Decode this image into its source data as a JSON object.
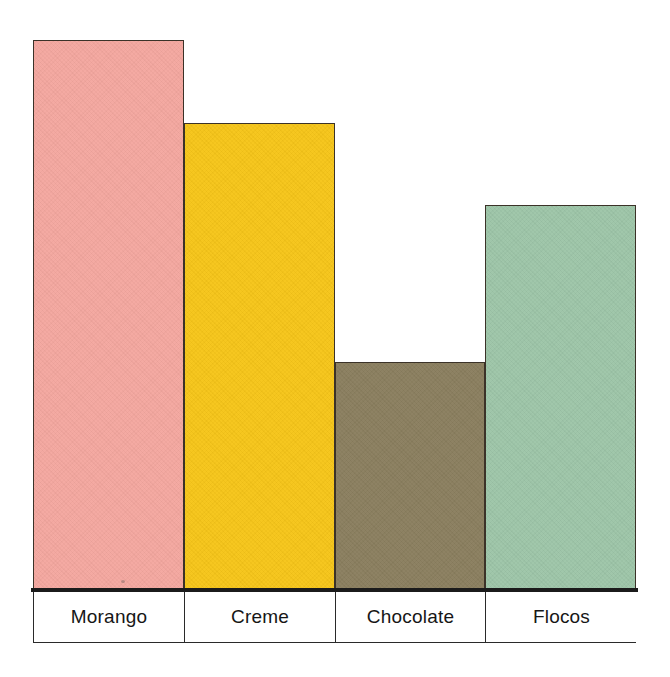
{
  "chart_data": {
    "type": "bar",
    "title": "",
    "subtitle": "",
    "xlabel": "",
    "ylabel": "",
    "categories": [
      "Morango",
      "Creme",
      "Chocolate",
      "Flocos"
    ],
    "values": [
      552,
      469,
      230,
      387
    ],
    "ylim": [
      0,
      562
    ],
    "grid": false,
    "legend": false,
    "axis_visible": {
      "x": true,
      "y": false
    },
    "bar_colors": [
      "#F4A79F",
      "#F6C518",
      "#8A7E5E",
      "#9DC5A8"
    ],
    "bar_border_color": "#3B3228",
    "axis_color": "#1B1B1B",
    "background": "#FFFFFF",
    "bars": [
      {
        "label": "Morango",
        "value": 552,
        "color": "#F4A79F"
      },
      {
        "label": "Creme",
        "value": 469,
        "color": "#F6C518"
      },
      {
        "label": "Chocolate",
        "value": 230,
        "color": "#8A7E5E"
      },
      {
        "label": "Flocos",
        "value": 387,
        "color": "#9DC5A8"
      }
    ]
  }
}
